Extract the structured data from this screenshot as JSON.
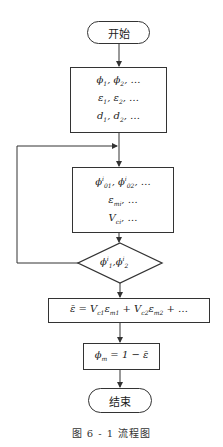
{
  "flowchart": {
    "start": {
      "label": "开始"
    },
    "input_box": {
      "lines": [
        "ϕ₁, ϕ₂, …",
        "ε₁, ε₂, …",
        "d₁, d₂, …"
      ],
      "line1": {
        "a": "ϕ",
        "a_sub": "1",
        "b": "ϕ",
        "b_sub": "2",
        "tail": ", …"
      },
      "line2": {
        "a": "ε",
        "a_sub": "1",
        "b": "ε",
        "b_sub": "2",
        "tail": ", …"
      },
      "line3": {
        "a": "d",
        "a_sub": "1",
        "b": "d",
        "b_sub": "2",
        "tail": ", …"
      }
    },
    "iteration_box": {
      "lines": [
        "ϕ⁰¹ⁱ, ϕ⁰²ⁱ, …",
        "ε_mi, …",
        "V_ci, …"
      ],
      "line1": {
        "a": "ϕ",
        "a_sup": "i",
        "a_sub": "01",
        "b": "ϕ",
        "b_sup": "i",
        "b_sub": "02",
        "tail": ", …"
      },
      "line2": {
        "a": "ε",
        "a_sub": "mi",
        "tail": ", …"
      },
      "line3": {
        "a": "V",
        "a_sub": "ci",
        "tail": ", …"
      }
    },
    "decision": {
      "label": "ϕ₁ⁱ, ϕ₂ⁱ",
      "a": "ϕ",
      "a_sup": "i",
      "a_sub": "1",
      "b": "ϕ",
      "b_sup": "i",
      "b_sub": "2"
    },
    "mean_strain_box": {
      "label": "ε̄ = V_c1 ε_m1 + V_c2 ε_m2 + …",
      "lhs": "ε̄",
      "eq": " = ",
      "t1_v": "V",
      "t1_v_sub": "c1",
      "t1_e": "ε",
      "t1_e_sub": "m1",
      "plus": " + ",
      "t2_v": "V",
      "t2_v_sub": "c2",
      "t2_e": "ε",
      "t2_e_sub": "m2",
      "tail": " + …"
    },
    "porosity_box": {
      "label": "ϕ_m = 1 − ε̄",
      "a": "ϕ",
      "a_sub": "m",
      "rhs": " = 1 − ε̄"
    },
    "end": {
      "label": "结束"
    }
  },
  "caption": "图 6 - 1   流程图",
  "colors": {
    "stroke": "#333333",
    "background": "#ffffff"
  }
}
